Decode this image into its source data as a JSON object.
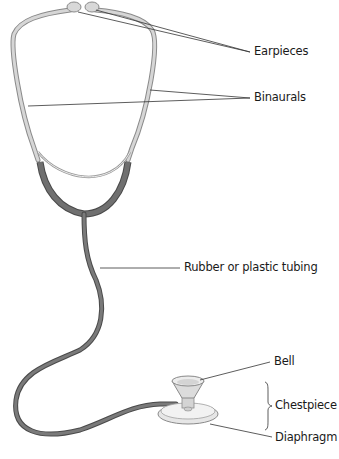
{
  "labels": {
    "earpieces": "Earpieces",
    "binaurals": "Binaurals",
    "tubing": "Rubber or plastic tubing",
    "bell": "Bell",
    "chestpiece": "Chestpiece",
    "diaphragm": "Diaphragm"
  },
  "colors": {
    "background": "#ffffff",
    "binaural_metal": "#c9c9c9",
    "binaural_outline": "#8a8a8a",
    "tubing": "#6e6e6e",
    "tubing_outline": "#4a4a4a",
    "chestpiece": "#e2e2e2",
    "leader_line": "#333333",
    "text": "#1a1a1a"
  }
}
